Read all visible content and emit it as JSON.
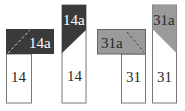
{
  "colors": {
    "dark": "#3a3a3a",
    "gray": "#9a9a9a",
    "white": "#ffffff",
    "outline": "#777777",
    "text_dark": "#2a2a2a",
    "text_light": "#ffffff"
  },
  "figures": [
    {
      "id": "fig1",
      "top_label": "14a",
      "bottom_label": "14",
      "style": "dark",
      "shape": "L-folded-horizontal"
    },
    {
      "id": "fig2",
      "top_label": "14a",
      "bottom_label": "14",
      "style": "dark",
      "shape": "vertical-strip-diagonal"
    },
    {
      "id": "fig3",
      "top_label": "31a",
      "bottom_label": "31",
      "style": "gray",
      "shape": "L-folded-horizontal"
    },
    {
      "id": "fig4",
      "top_label": "31a",
      "bottom_label": "31",
      "style": "gray",
      "shape": "vertical-strip-diagonal"
    }
  ]
}
